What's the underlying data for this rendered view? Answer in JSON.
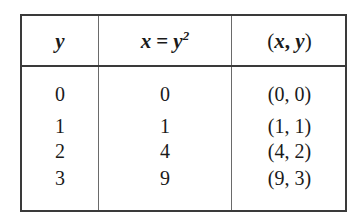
{
  "table": {
    "headers": {
      "col1": "y",
      "col2_lhs": "x",
      "col2_eq": "=",
      "col2_base": "y",
      "col2_exp": "2",
      "col3_open": "(",
      "col3_x": "x",
      "col3_sep": ", ",
      "col3_y": "y",
      "col3_close": ")"
    },
    "rows": [
      {
        "y": "0",
        "x": "0",
        "point": "(0, 0)"
      },
      {
        "y": "1",
        "x": "1",
        "point": "(1, 1)"
      },
      {
        "y": "2",
        "x": "4",
        "point": "(4, 2)"
      },
      {
        "y": "3",
        "x": "9",
        "point": "(9, 3)"
      }
    ]
  }
}
